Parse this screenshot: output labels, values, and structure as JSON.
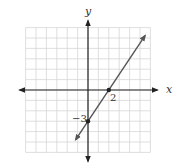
{
  "chart_data": {
    "type": "line",
    "title": "",
    "xlabel": "x",
    "ylabel": "y",
    "xlim": [
      -6,
      6
    ],
    "ylim": [
      -6,
      6
    ],
    "grid": true,
    "series": [
      {
        "name": "line",
        "equation": "y = 1.5x - 3",
        "slope": 1.5,
        "intercept": -3,
        "x": [
          -1.2,
          0,
          2,
          5.5
        ],
        "y": [
          -4.8,
          -3,
          0,
          5.25
        ],
        "color": "#555555"
      }
    ],
    "points": [
      {
        "x": 2,
        "y": 0,
        "label": "2"
      },
      {
        "x": 0,
        "y": -3,
        "label": "−3"
      }
    ],
    "annotations": [
      "2",
      "−3"
    ]
  },
  "labels": {
    "x_axis": "x",
    "y_axis": "y",
    "x_intercept": "2",
    "y_intercept": "−3"
  },
  "colors": {
    "grid": "#d6d6d6",
    "axis": "#222222",
    "line": "#555555"
  }
}
